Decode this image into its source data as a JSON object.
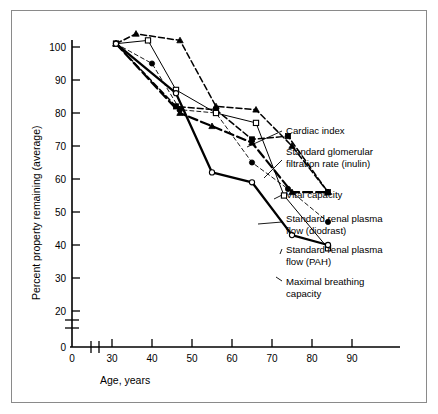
{
  "figure": {
    "background": "#ffffff",
    "frame_color": "#8a8a8a",
    "ink_color": "#000000"
  },
  "axes": {
    "x_title": "Age, years",
    "y_title": "Percent property remaining (average)",
    "x_ticks": [
      "0",
      "30",
      "40",
      "50",
      "60",
      "70",
      "80",
      "90"
    ],
    "y_ticks": [
      "0",
      "20",
      "30",
      "40",
      "50",
      "60",
      "70",
      "80",
      "90",
      "100"
    ],
    "x_break": true,
    "y_break": true
  },
  "annotations": [
    {
      "id": "cardiac-index",
      "lines": [
        "Cardiac index"
      ]
    },
    {
      "id": "sgfr-inulin",
      "lines": [
        "Standard glomerular",
        "filtration rate (inulin)"
      ]
    },
    {
      "id": "vital-capacity",
      "lines": [
        "Vital capacity"
      ]
    },
    {
      "id": "srpf-diodrast",
      "lines": [
        "Standard renal plasma",
        "flow (diodrast)"
      ]
    },
    {
      "id": "srpf-pah",
      "lines": [
        "Standard renal plasma",
        "flow (PAH)"
      ]
    },
    {
      "id": "maximal-breathing",
      "lines": [
        "Maximal breathing",
        "capacity"
      ]
    }
  ],
  "chart_data": {
    "type": "line",
    "title": "",
    "xlabel": "Age, years",
    "ylabel": "Percent property remaining (average)",
    "xlim": [
      28,
      92
    ],
    "ylim": [
      20,
      104
    ],
    "xticks": [
      30,
      40,
      50,
      60,
      70,
      80,
      90
    ],
    "yticks": [
      20,
      30,
      40,
      50,
      60,
      70,
      80,
      90,
      100
    ],
    "grid": false,
    "legend": "annotated-leader-lines",
    "axis_break_x": true,
    "axis_break_y": true,
    "series": [
      {
        "name": "Cardiac index",
        "marker": "filled-triangle",
        "linestyle": "dashed",
        "points": [
          {
            "x": 31,
            "y": 101
          },
          {
            "x": 36,
            "y": 104
          },
          {
            "x": 47,
            "y": 102
          },
          {
            "x": 56,
            "y": 82
          },
          {
            "x": 66,
            "y": 81
          },
          {
            "x": 75,
            "y": 70
          },
          {
            "x": 84,
            "y": 56
          }
        ]
      },
      {
        "name": "Standard glomerular filtration rate (inulin)",
        "marker": "filled-square",
        "linestyle": "dashed",
        "points": [
          {
            "x": 31,
            "y": 101
          },
          {
            "x": 46,
            "y": 82
          },
          {
            "x": 56,
            "y": 81
          },
          {
            "x": 65,
            "y": 72
          },
          {
            "x": 74,
            "y": 73
          },
          {
            "x": 84,
            "y": 56
          }
        ]
      },
      {
        "name": "Vital capacity",
        "marker": "filled-triangle",
        "linestyle": "longdash",
        "points": [
          {
            "x": 31,
            "y": 101
          },
          {
            "x": 47,
            "y": 80
          },
          {
            "x": 55,
            "y": 76
          },
          {
            "x": 65,
            "y": 71
          },
          {
            "x": 75,
            "y": 56
          },
          {
            "x": 84,
            "y": 56
          }
        ]
      },
      {
        "name": "Standard renal plasma flow (diodrast)",
        "marker": "filled-circle",
        "linestyle": "dashed-fine",
        "points": [
          {
            "x": 31,
            "y": 101
          },
          {
            "x": 40,
            "y": 95
          },
          {
            "x": 47,
            "y": 81
          },
          {
            "x": 56,
            "y": 80
          },
          {
            "x": 65,
            "y": 65
          },
          {
            "x": 74,
            "y": 57
          },
          {
            "x": 84,
            "y": 47
          }
        ]
      },
      {
        "name": "Standard renal plasma flow (PAH)",
        "marker": "open-square",
        "linestyle": "solid-thin",
        "points": [
          {
            "x": 31,
            "y": 101
          },
          {
            "x": 39,
            "y": 102
          },
          {
            "x": 46,
            "y": 87
          },
          {
            "x": 56,
            "y": 80
          },
          {
            "x": 66,
            "y": 77
          },
          {
            "x": 73,
            "y": 55
          },
          {
            "x": 84,
            "y": 39
          }
        ]
      },
      {
        "name": "Maximal breathing capacity",
        "marker": "open-circle",
        "linestyle": "solid-thick",
        "points": [
          {
            "x": 31,
            "y": 101
          },
          {
            "x": 46,
            "y": 86
          },
          {
            "x": 55,
            "y": 62
          },
          {
            "x": 65,
            "y": 59
          },
          {
            "x": 75,
            "y": 43
          },
          {
            "x": 84,
            "y": 40
          }
        ]
      }
    ]
  }
}
